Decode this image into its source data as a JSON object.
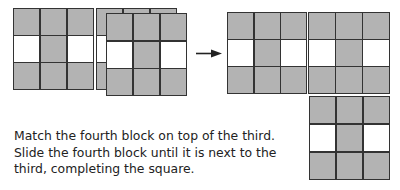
{
  "diagram": {
    "colors": {
      "shaded": "#b3b3b3",
      "unshaded": "#ffffff",
      "line": "#333333"
    },
    "pattern": [
      [
        "shaded",
        "shaded",
        "shaded"
      ],
      [
        "white",
        "shaded",
        "white"
      ],
      [
        "shaded",
        "shaded",
        "shaded"
      ]
    ],
    "blocks": [
      {
        "id": "block-1",
        "role": "first block (left)"
      },
      {
        "id": "block-2",
        "role": "third block (back of stack)"
      },
      {
        "id": "block-3",
        "role": "fourth block (front of stack)"
      },
      {
        "id": "block-result-left",
        "role": "result block left"
      },
      {
        "id": "block-result-right",
        "role": "third block after slide"
      },
      {
        "id": "block-result-below",
        "role": "block below"
      }
    ],
    "arrow": {
      "direction": "right"
    }
  },
  "caption": {
    "text": "Match the fourth block on top of the third. Slide the fourth block until it is next to the third, completing the square."
  }
}
